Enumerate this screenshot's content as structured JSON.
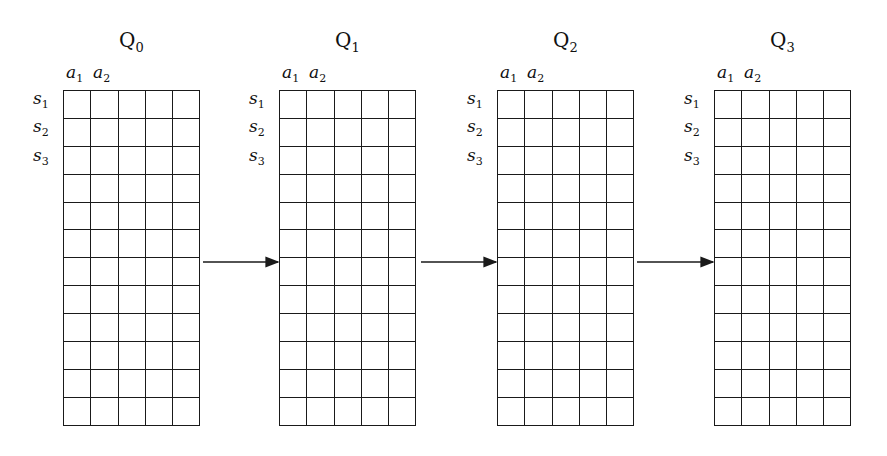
{
  "diagram": {
    "type": "q-table-sequence",
    "rows": 12,
    "cols": 5,
    "tables": [
      {
        "title_base": "Q",
        "title_sub": "0",
        "col_labels": [
          {
            "b": "a",
            "s": "1"
          },
          {
            "b": "a",
            "s": "2"
          }
        ],
        "row_labels": [
          {
            "b": "s",
            "s": "1"
          },
          {
            "b": "s",
            "s": "2"
          },
          {
            "b": "s",
            "s": "3"
          }
        ]
      },
      {
        "title_base": "Q",
        "title_sub": "1",
        "col_labels": [
          {
            "b": "a",
            "s": "1"
          },
          {
            "b": "a",
            "s": "2"
          }
        ],
        "row_labels": [
          {
            "b": "s",
            "s": "1"
          },
          {
            "b": "s",
            "s": "2"
          },
          {
            "b": "s",
            "s": "3"
          }
        ]
      },
      {
        "title_base": "Q",
        "title_sub": "2",
        "col_labels": [
          {
            "b": "a",
            "s": "1"
          },
          {
            "b": "a",
            "s": "2"
          }
        ],
        "row_labels": [
          {
            "b": "s",
            "s": "1"
          },
          {
            "b": "s",
            "s": "2"
          },
          {
            "b": "s",
            "s": "3"
          }
        ]
      },
      {
        "title_base": "Q",
        "title_sub": "3",
        "col_labels": [
          {
            "b": "a",
            "s": "1"
          },
          {
            "b": "a",
            "s": "2"
          }
        ],
        "row_labels": [
          {
            "b": "s",
            "s": "1"
          },
          {
            "b": "s",
            "s": "2"
          },
          {
            "b": "s",
            "s": "3"
          }
        ]
      }
    ],
    "arrows": [
      {
        "from": "Q0",
        "to": "Q1"
      },
      {
        "from": "Q1",
        "to": "Q2"
      },
      {
        "from": "Q2",
        "to": "Q3"
      }
    ],
    "colors": {
      "line": "#1a1a1a",
      "background": "#ffffff"
    }
  }
}
